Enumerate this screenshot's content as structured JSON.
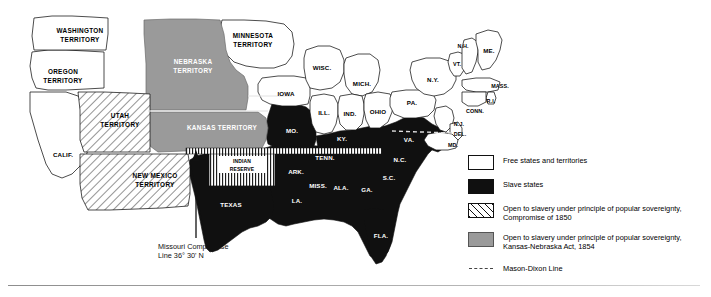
{
  "figure": {
    "name": "map-of-united-states-slavery-1854",
    "annotation": {
      "line1": "Missouri Compromise",
      "line2": "Line 36° 30' N"
    }
  },
  "map": {
    "free_states": [
      {
        "id": "calif",
        "label": "CALIF.",
        "x": 63,
        "y": 155
      },
      {
        "id": "iowa",
        "label": "IOWA",
        "x": 286,
        "y": 94
      },
      {
        "id": "wisc",
        "label": "WISC.",
        "x": 320,
        "y": 68
      },
      {
        "id": "mich",
        "label": "MICH.",
        "x": 362,
        "y": 84
      },
      {
        "id": "ill",
        "label": "ILL.",
        "x": 325,
        "y": 113
      },
      {
        "id": "ind",
        "label": "IND.",
        "x": 350,
        "y": 114
      },
      {
        "id": "ohio",
        "label": "OHIO",
        "x": 377,
        "y": 113
      },
      {
        "id": "pa",
        "label": "PA.",
        "x": 411,
        "y": 103
      },
      {
        "id": "ny",
        "label": "N.Y.",
        "x": 434,
        "y": 81
      },
      {
        "id": "vt",
        "label": "VT.",
        "x": 456,
        "y": 64
      },
      {
        "id": "nh",
        "label": "N.H.",
        "x": 461,
        "y": 47
      },
      {
        "id": "me",
        "label": "ME.",
        "x": 487,
        "y": 52
      },
      {
        "id": "mass",
        "label": "MASS.",
        "x": 490,
        "y": 89
      },
      {
        "id": "ri",
        "label": "R.I.",
        "x": 484,
        "y": 102
      },
      {
        "id": "conn",
        "label": "CONN.",
        "x": 466,
        "y": 112
      },
      {
        "id": "nj",
        "label": "N.J.",
        "x": 456,
        "y": 124
      },
      {
        "id": "del",
        "label": "DEL.",
        "x": 458,
        "y": 135
      },
      {
        "id": "md",
        "label": "MD.",
        "x": 452,
        "y": 145
      }
    ],
    "slave_states": [
      {
        "id": "mo",
        "label": "MO.",
        "x": 294,
        "y": 131
      },
      {
        "id": "ky",
        "label": "KY.",
        "x": 340,
        "y": 143
      },
      {
        "id": "va",
        "label": "VA.",
        "x": 409,
        "y": 140
      },
      {
        "id": "ark",
        "label": "ARK.",
        "x": 296,
        "y": 172
      },
      {
        "id": "tenn",
        "label": "TENN.",
        "x": 323,
        "y": 159
      },
      {
        "id": "nc",
        "label": "N.C.",
        "x": 401,
        "y": 160
      },
      {
        "id": "sc",
        "label": "S.C.",
        "x": 390,
        "y": 177
      },
      {
        "id": "miss",
        "label": "MISS.",
        "x": 318,
        "y": 186
      },
      {
        "id": "ala",
        "label": "ALA.",
        "x": 340,
        "y": 186
      },
      {
        "id": "ga",
        "label": "GA.",
        "x": 367,
        "y": 188
      },
      {
        "id": "la",
        "label": "LA.",
        "x": 298,
        "y": 199
      },
      {
        "id": "fla",
        "label": "FLA.",
        "x": 384,
        "y": 235
      },
      {
        "id": "texas",
        "label": "TEXAS",
        "x": 231,
        "y": 205
      }
    ],
    "territories": [
      {
        "id": "washington",
        "label_line1": "WASHINGTON",
        "label_line2": "TERRITORY",
        "x": 80,
        "y": 35,
        "fill": "free"
      },
      {
        "id": "oregon",
        "label_line1": "OREGON",
        "label_line2": "TERRITORY",
        "x": 63,
        "y": 77,
        "fill": "free"
      },
      {
        "id": "minnesota",
        "label_line1": "MINNESOTA",
        "label_line2": "TERRITORY",
        "x": 253,
        "y": 40,
        "fill": "free"
      },
      {
        "id": "nebraska",
        "label_line1": "NEBRASKA",
        "label_line2": "TERRITORY",
        "x": 193,
        "y": 66,
        "fill": "gray"
      },
      {
        "id": "kansas",
        "label_line1": "KANSAS TERRITORY",
        "label_line2": "",
        "x": 222,
        "y": 128,
        "fill": "gray"
      },
      {
        "id": "utah",
        "label_line1": "UTAH",
        "label_line2": "TERRITORY",
        "x": 120,
        "y": 120,
        "fill": "hatch"
      },
      {
        "id": "new-mexico",
        "label_line1": "NEW MEXICO",
        "label_line2": "TERRITORY",
        "x": 155,
        "y": 180,
        "fill": "hatch"
      },
      {
        "id": "indian-reserve",
        "label_line1": "INDIAN",
        "label_line2": "RESERVE",
        "x": 235,
        "y": 160,
        "fill": "vertical-stripe"
      }
    ]
  },
  "legend": {
    "items": [
      {
        "id": "free",
        "swatch": "free",
        "line1": "Free states and territories",
        "line2": ""
      },
      {
        "id": "slave",
        "swatch": "slave",
        "line1": "Slave states",
        "line2": ""
      },
      {
        "id": "popular-sovereignty-1850",
        "swatch": "hatch",
        "line1": "Open to slavery under principle of popular sovereignty,",
        "line2": "Compromise of 1850"
      },
      {
        "id": "popular-sovereignty-1854",
        "swatch": "gray",
        "line1": "Open to slavery under principle of popular sovereignty,",
        "line2": "Kansas-Nebraska Act, 1854"
      },
      {
        "id": "mason-dixon",
        "swatch": "dashed-line",
        "line1": "Mason-Dixon Line",
        "line2": ""
      }
    ]
  },
  "colors": {
    "slave_fill": "#101010",
    "free_fill": "#ffffff",
    "territory_gray": "#9a9a9a",
    "outline": "#111111",
    "mason_dixon": "#444444"
  }
}
